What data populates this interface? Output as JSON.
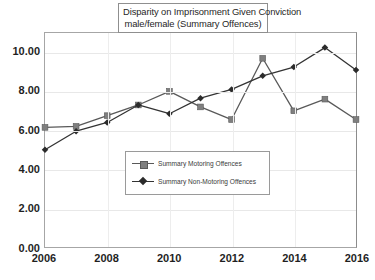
{
  "chart_data": {
    "type": "line",
    "title": "Disparity on Imprisonment Given Conviction male/female (Summary Offences)",
    "title_lines": [
      "Disparity on Imprisonment Given Conviction",
      "male/female (Summary Offences)"
    ],
    "xlabel": "",
    "ylabel": "",
    "x": [
      2006,
      2007,
      2008,
      2009,
      2010,
      2011,
      2012,
      2013,
      2014,
      2015,
      2016
    ],
    "xtick_labels": [
      "2006",
      "2008",
      "2010",
      "2012",
      "2014",
      "2016"
    ],
    "xtick_values": [
      2006,
      2008,
      2010,
      2012,
      2014,
      2016
    ],
    "ytick_labels": [
      "0.00",
      "2.00",
      "4.00",
      "6.00",
      "8.00",
      "10.00"
    ],
    "ytick_values": [
      0,
      2,
      4,
      6,
      8,
      10
    ],
    "ylim": [
      0,
      11
    ],
    "xlim": [
      2006,
      2016
    ],
    "grid": true,
    "legend_position": "center",
    "series": [
      {
        "name": "Summary Motoring Offences",
        "marker": "square",
        "color": "#7f7f7f",
        "line_color": "#595959",
        "values": [
          6.15,
          6.2,
          6.75,
          7.3,
          8.0,
          7.2,
          6.55,
          9.7,
          7.0,
          7.6,
          6.55
        ]
      },
      {
        "name": "Summary Non-Motoring Offences",
        "marker": "diamond",
        "color": "#2b2b2b",
        "line_color": "#333333",
        "values": [
          5.0,
          5.95,
          6.4,
          7.3,
          6.85,
          7.65,
          8.1,
          8.8,
          9.25,
          10.25,
          9.1
        ]
      }
    ]
  }
}
